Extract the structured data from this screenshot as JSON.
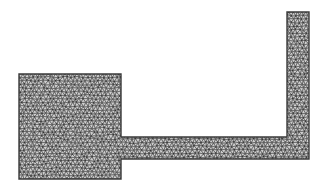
{
  "diagram": {
    "type": "triangulated-mesh-domain",
    "regions": [
      {
        "name": "square-block"
      },
      {
        "name": "horizontal-channel"
      },
      {
        "name": "vertical-arm"
      }
    ],
    "colors": {
      "boundary": "#3a3a3a",
      "mesh_edge": "#5a5a5a",
      "fill": "#cfcfcf",
      "background": "#ffffff"
    }
  }
}
